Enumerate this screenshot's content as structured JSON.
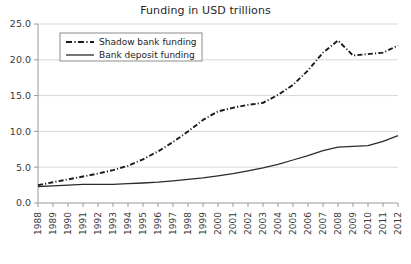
{
  "chart_data": {
    "type": "line",
    "title": "Funding in USD trillions",
    "xlabel": "",
    "ylabel": "",
    "ylim": [
      0.0,
      25.0
    ],
    "yticks": [
      "0.0",
      "5.0",
      "10.0",
      "15.0",
      "20.0",
      "25.0"
    ],
    "ytick_values": [
      0.0,
      5.0,
      10.0,
      15.0,
      20.0,
      25.0
    ],
    "grid": "horizontal",
    "legend_position": "upper-left-inside",
    "categories": [
      "1988",
      "1989",
      "1990",
      "1991",
      "1992",
      "1993",
      "1994",
      "1995",
      "1996",
      "1997",
      "1998",
      "1999",
      "2000",
      "2001",
      "2002",
      "2003",
      "2004",
      "2005",
      "2006",
      "2007",
      "2008",
      "2009",
      "2010",
      "2011",
      "2012"
    ],
    "series": [
      {
        "name": "Shadow bank funding",
        "style": "dash-dot",
        "color": "#1a1a1a",
        "values": [
          2.5,
          2.9,
          3.3,
          3.7,
          4.1,
          4.6,
          5.2,
          6.1,
          7.2,
          8.5,
          10.0,
          11.6,
          12.8,
          13.3,
          13.7,
          14.0,
          15.1,
          16.5,
          18.5,
          21.0,
          22.7,
          20.6,
          20.8,
          21.0,
          22.0
        ]
      },
      {
        "name": "Bank deposit funding",
        "style": "solid",
        "color": "#2b2b2b",
        "values": [
          2.3,
          2.4,
          2.5,
          2.6,
          2.6,
          2.6,
          2.7,
          2.8,
          2.9,
          3.1,
          3.3,
          3.5,
          3.8,
          4.1,
          4.5,
          4.9,
          5.4,
          6.0,
          6.6,
          7.3,
          7.8,
          7.9,
          8.0,
          8.6,
          9.4
        ]
      }
    ]
  }
}
